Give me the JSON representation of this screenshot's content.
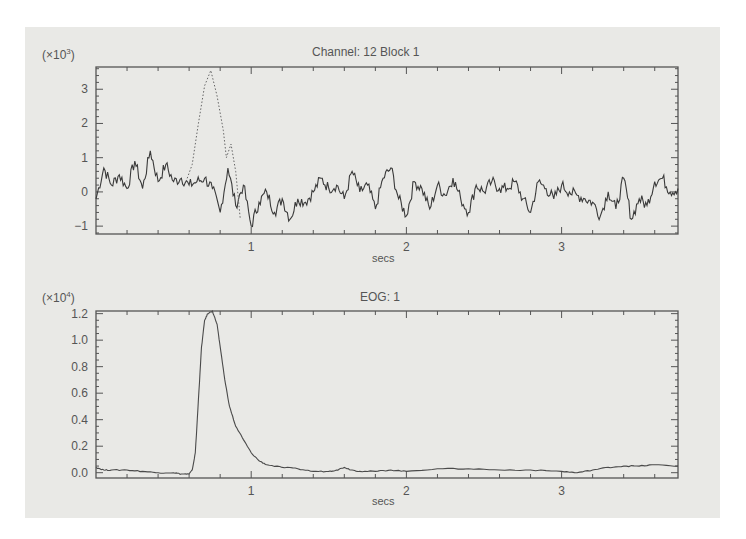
{
  "chart_data": [
    {
      "type": "line",
      "title": "Channel: 12 Block   1",
      "ylabel_multiplier": "(×10³)",
      "multiplier_base": "×10",
      "multiplier_exp": "3",
      "xlabel": "secs",
      "xlim": [
        0,
        3.75
      ],
      "ylim": [
        -1.23,
        3.65
      ],
      "xticks": [
        1,
        2,
        3
      ],
      "xtick_labels": [
        "1",
        "2",
        "3"
      ],
      "yticks": [
        -1,
        0,
        1,
        2,
        3
      ],
      "ytick_labels": [
        "−1",
        "0",
        "1",
        "2",
        "3"
      ],
      "minor_xtick_step": 0.2,
      "minor_ytick_step": 0.2,
      "grid": false,
      "series": [
        {
          "name": "channel-12-signal",
          "style": "solid",
          "color": "#3a3a3a",
          "x": [
            0.0,
            0.05,
            0.1,
            0.15,
            0.2,
            0.25,
            0.3,
            0.35,
            0.4,
            0.45,
            0.5,
            0.55,
            0.6,
            0.65,
            0.7,
            0.75,
            0.8,
            0.85,
            0.9,
            0.95,
            1.0,
            1.05,
            1.1,
            1.15,
            1.2,
            1.25,
            1.3,
            1.35,
            1.4,
            1.45,
            1.5,
            1.55,
            1.6,
            1.65,
            1.7,
            1.75,
            1.8,
            1.85,
            1.9,
            1.95,
            2.0,
            2.05,
            2.1,
            2.15,
            2.2,
            2.25,
            2.3,
            2.35,
            2.4,
            2.45,
            2.5,
            2.55,
            2.6,
            2.65,
            2.7,
            2.75,
            2.8,
            2.85,
            2.9,
            2.95,
            3.0,
            3.05,
            3.1,
            3.15,
            3.2,
            3.25,
            3.3,
            3.35,
            3.4,
            3.45,
            3.5,
            3.55,
            3.6,
            3.65,
            3.7,
            3.75
          ],
          "values": [
            -0.2,
            0.7,
            0.2,
            0.5,
            0.1,
            0.9,
            0.1,
            1.2,
            0.3,
            0.8,
            0.3,
            0.4,
            0.2,
            0.3,
            0.4,
            0.1,
            -0.6,
            0.7,
            -0.4,
            0.2,
            -1.0,
            -0.3,
            0.0,
            -0.6,
            -0.2,
            -0.8,
            -0.2,
            -0.3,
            0.0,
            0.4,
            0.1,
            0.2,
            -0.2,
            0.6,
            0.0,
            0.2,
            -0.5,
            0.4,
            0.7,
            -0.2,
            -0.7,
            0.3,
            0.1,
            -0.5,
            0.2,
            -0.1,
            0.4,
            -0.2,
            -0.6,
            0.2,
            0.0,
            0.3,
            0.1,
            0.1,
            0.3,
            -0.2,
            -0.6,
            0.3,
            0.1,
            -0.2,
            0.2,
            0.0,
            -0.1,
            -0.2,
            -0.3,
            -0.7,
            0.0,
            -0.5,
            0.4,
            -0.8,
            -0.2,
            -0.4,
            0.3,
            0.4,
            0.0,
            0.1
          ]
        },
        {
          "name": "channel-12-dotted-artifact",
          "style": "dotted",
          "color": "#666666",
          "x": [
            0.58,
            0.62,
            0.66,
            0.7,
            0.74,
            0.78,
            0.82,
            0.84,
            0.87,
            0.9,
            0.93
          ],
          "values": [
            0.3,
            0.8,
            2.0,
            3.1,
            3.55,
            2.8,
            1.8,
            1.0,
            1.4,
            0.6,
            -0.8
          ]
        }
      ]
    },
    {
      "type": "line",
      "title": "EOG:   1",
      "ylabel_multiplier": "(×10⁴)",
      "multiplier_base": "×10",
      "multiplier_exp": "4",
      "xlabel": "secs",
      "xlim": [
        0,
        3.75
      ],
      "ylim": [
        -0.04,
        1.22
      ],
      "xticks": [
        1,
        2,
        3
      ],
      "xtick_labels": [
        "1",
        "2",
        "3"
      ],
      "yticks": [
        0.0,
        0.2,
        0.4,
        0.6,
        0.8,
        1.0,
        1.2
      ],
      "ytick_labels": [
        "0.0",
        "0.2",
        "0.4",
        "0.6",
        "0.8",
        "1.0",
        "1.2"
      ],
      "minor_xtick_step": 0.2,
      "minor_ytick_step": 0.05,
      "grid": false,
      "series": [
        {
          "name": "eog-signal",
          "style": "solid",
          "color": "#4a4a4a",
          "x": [
            0.0,
            0.05,
            0.1,
            0.2,
            0.3,
            0.4,
            0.5,
            0.55,
            0.6,
            0.62,
            0.64,
            0.66,
            0.68,
            0.7,
            0.72,
            0.75,
            0.78,
            0.8,
            0.83,
            0.86,
            0.9,
            0.95,
            1.0,
            1.05,
            1.1,
            1.2,
            1.3,
            1.4,
            1.5,
            1.55,
            1.6,
            1.65,
            1.7,
            1.8,
            1.9,
            2.0,
            2.2,
            2.4,
            2.6,
            2.8,
            3.0,
            3.1,
            3.2,
            3.3,
            3.4,
            3.5,
            3.6,
            3.75
          ],
          "values": [
            0.04,
            0.02,
            0.02,
            0.02,
            0.01,
            0.0,
            0.0,
            -0.01,
            -0.01,
            0.02,
            0.15,
            0.55,
            0.95,
            1.15,
            1.2,
            1.22,
            1.12,
            0.95,
            0.7,
            0.5,
            0.35,
            0.25,
            0.15,
            0.09,
            0.06,
            0.04,
            0.03,
            0.01,
            0.01,
            0.02,
            0.04,
            0.02,
            0.01,
            0.01,
            0.02,
            0.01,
            0.03,
            0.03,
            0.02,
            0.02,
            0.01,
            0.0,
            0.02,
            0.04,
            0.05,
            0.05,
            0.06,
            0.05
          ]
        }
      ]
    }
  ]
}
